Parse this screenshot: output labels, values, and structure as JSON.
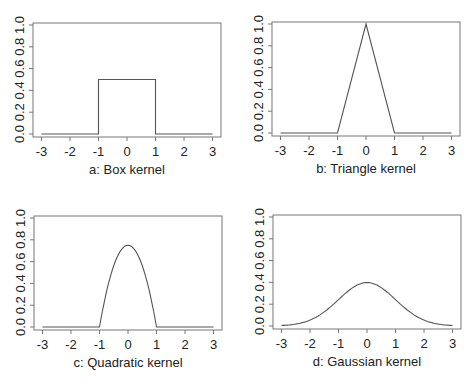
{
  "figure": {
    "background": "#ffffff",
    "line_color": "#555555",
    "frame_color": "#777777"
  },
  "chart_data": [
    {
      "id": "a",
      "type": "line",
      "title": "a: Box kernel",
      "xlabel": "a: Box kernel",
      "ylabel": "",
      "xlim": [
        -3,
        3
      ],
      "ylim": [
        0,
        1
      ],
      "xticks": [
        -3,
        -2,
        -1,
        0,
        1,
        2,
        3
      ],
      "xtick_labels": [
        "-3",
        "-2",
        "-1",
        "0",
        "1",
        "2",
        "3"
      ],
      "yticks": [
        0,
        0.2,
        0.4,
        0.6,
        0.8,
        1.0
      ],
      "ytick_labels": [
        "0.0",
        "0.2",
        "0.4",
        "0.6",
        "0.8",
        "1.0"
      ],
      "grid": false,
      "legend": null,
      "kernel": "box",
      "series": [
        {
          "name": "Box kernel",
          "x": [
            -3,
            -1,
            -1,
            1,
            1,
            3
          ],
          "y": [
            0,
            0,
            0.5,
            0.5,
            0,
            0
          ]
        }
      ]
    },
    {
      "id": "b",
      "type": "line",
      "title": "b: Triangle kernel",
      "xlabel": "b: Triangle kernel",
      "ylabel": "",
      "xlim": [
        -3,
        3
      ],
      "ylim": [
        0,
        1
      ],
      "xticks": [
        -3,
        -2,
        -1,
        0,
        1,
        2,
        3
      ],
      "xtick_labels": [
        "-3",
        "-2",
        "-1",
        "0",
        "1",
        "2",
        "3"
      ],
      "yticks": [
        0,
        0.2,
        0.4,
        0.6,
        0.8,
        1.0
      ],
      "ytick_labels": [
        "0.0",
        "0.2",
        "0.4",
        "0.6",
        "0.8",
        "1.0"
      ],
      "grid": false,
      "legend": null,
      "kernel": "triangle",
      "series": [
        {
          "name": "Triangle kernel",
          "x": [
            -3,
            -1,
            0,
            1,
            3
          ],
          "y": [
            0,
            0,
            1.0,
            0,
            0
          ]
        }
      ]
    },
    {
      "id": "c",
      "type": "line",
      "title": "c: Quadratic kernel",
      "xlabel": "c: Quadratic kernel",
      "ylabel": "",
      "xlim": [
        -3,
        3
      ],
      "ylim": [
        0,
        1
      ],
      "xticks": [
        -3,
        -2,
        -1,
        0,
        1,
        2,
        3
      ],
      "xtick_labels": [
        "-3",
        "-2",
        "-1",
        "0",
        "1",
        "2",
        "3"
      ],
      "yticks": [
        0,
        0.2,
        0.4,
        0.6,
        0.8,
        1.0
      ],
      "ytick_labels": [
        "0.0",
        "0.2",
        "0.4",
        "0.6",
        "0.8",
        "1.0"
      ],
      "grid": false,
      "legend": null,
      "kernel": "quadratic",
      "series": [
        {
          "name": "Quadratic kernel",
          "x": [
            -3,
            -1,
            -0.75,
            -0.5,
            -0.25,
            0,
            0.25,
            0.5,
            0.75,
            1,
            3
          ],
          "y": [
            0,
            0,
            0.328,
            0.5625,
            0.703,
            0.75,
            0.703,
            0.5625,
            0.328,
            0,
            0
          ]
        }
      ]
    },
    {
      "id": "d",
      "type": "line",
      "title": "d: Gaussian kernel",
      "xlabel": "d: Gaussian kernel",
      "ylabel": "",
      "xlim": [
        -3,
        3
      ],
      "ylim": [
        0,
        1
      ],
      "xticks": [
        -3,
        -2,
        -1,
        0,
        1,
        2,
        3
      ],
      "xtick_labels": [
        "-3",
        "-2",
        "-1",
        "0",
        "1",
        "2",
        "3"
      ],
      "yticks": [
        0,
        0.2,
        0.4,
        0.6,
        0.8,
        1.0
      ],
      "ytick_labels": [
        "0.0",
        "0.2",
        "0.4",
        "0.6",
        "0.8",
        "1.0"
      ],
      "grid": false,
      "legend": null,
      "kernel": "gaussian",
      "series": [
        {
          "name": "Gaussian kernel",
          "x": [
            -3,
            -2.5,
            -2,
            -1.5,
            -1,
            -0.5,
            0,
            0.5,
            1,
            1.5,
            2,
            2.5,
            3
          ],
          "y": [
            0.0044,
            0.0175,
            0.054,
            0.1295,
            0.242,
            0.352,
            0.399,
            0.352,
            0.242,
            0.1295,
            0.054,
            0.0175,
            0.0044
          ]
        }
      ]
    }
  ]
}
